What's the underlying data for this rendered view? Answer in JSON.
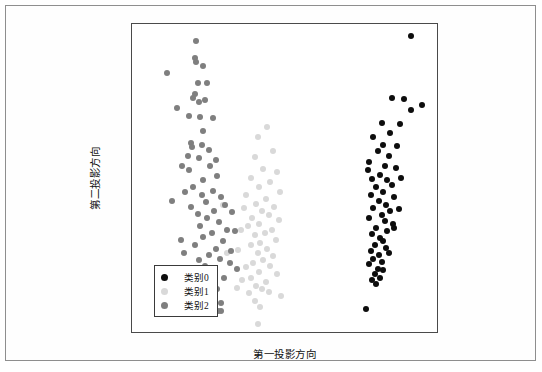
{
  "axes": {
    "xlabel": "第一投影方向",
    "ylabel": "第二投影方向",
    "xticks": [
      "-10.0",
      "-7.5",
      "-5.0",
      "-2.5",
      "0.0",
      "2.5",
      "5.0",
      "7.5",
      "10.0"
    ],
    "yticks": [
      "3",
      "2",
      "1",
      "0",
      "-1",
      "-2"
    ]
  },
  "legend": {
    "items": [
      {
        "label": "类别0",
        "color": "#0d0d0d"
      },
      {
        "label": "类别1",
        "color": "#d9d9d9"
      },
      {
        "label": "类别2",
        "color": "#7f7f7f"
      }
    ]
  },
  "chart_data": {
    "type": "scatter",
    "title": "",
    "xlabel": "第一投影方向",
    "ylabel": "第二投影方向",
    "xlim": [
      -11.0,
      11.0
    ],
    "ylim": [
      -2.35,
      3.0
    ],
    "xticks": [
      -10.0,
      -7.5,
      -5.0,
      -2.5,
      0.0,
      2.5,
      5.0,
      7.5,
      10.0
    ],
    "yticks": [
      -2,
      -1,
      0,
      1,
      2,
      3
    ],
    "grid": false,
    "legend_position": "lower left",
    "marker_size": 6,
    "series": [
      {
        "name": "类别0",
        "color": "#0d0d0d",
        "points": [
          [
            9.0,
            2.8
          ],
          [
            7.6,
            1.72
          ],
          [
            8.5,
            1.7
          ],
          [
            9.0,
            1.52
          ],
          [
            9.8,
            1.6
          ],
          [
            6.9,
            1.3
          ],
          [
            8.2,
            1.28
          ],
          [
            7.5,
            1.12
          ],
          [
            6.3,
            1.05
          ],
          [
            7.0,
            0.92
          ],
          [
            8.0,
            0.9
          ],
          [
            6.6,
            0.8
          ],
          [
            7.4,
            0.72
          ],
          [
            6.0,
            0.62
          ],
          [
            7.1,
            0.55
          ],
          [
            7.9,
            0.52
          ],
          [
            6.8,
            0.4
          ],
          [
            6.2,
            0.33
          ],
          [
            7.3,
            0.3
          ],
          [
            7.6,
            0.22
          ],
          [
            6.5,
            0.18
          ],
          [
            7.0,
            0.1
          ],
          [
            6.1,
            0.05
          ],
          [
            7.8,
            0.02
          ],
          [
            6.7,
            -0.05
          ],
          [
            7.2,
            -0.12
          ],
          [
            6.3,
            -0.18
          ],
          [
            7.5,
            -0.22
          ],
          [
            6.9,
            -0.3
          ],
          [
            6.0,
            -0.35
          ],
          [
            7.1,
            -0.4
          ],
          [
            7.7,
            -0.45
          ],
          [
            6.5,
            -0.52
          ],
          [
            7.3,
            -0.58
          ],
          [
            6.2,
            -0.62
          ],
          [
            6.8,
            -0.7
          ],
          [
            7.0,
            -0.75
          ],
          [
            6.4,
            -0.82
          ],
          [
            7.2,
            -0.86
          ],
          [
            6.1,
            -0.92
          ],
          [
            6.7,
            -0.98
          ],
          [
            7.4,
            -0.95
          ],
          [
            6.3,
            -1.05
          ],
          [
            6.9,
            -1.1
          ],
          [
            6.0,
            -1.15
          ],
          [
            6.6,
            -1.22
          ],
          [
            7.0,
            -1.25
          ],
          [
            6.4,
            -1.32
          ],
          [
            6.8,
            -1.38
          ],
          [
            6.2,
            -1.42
          ],
          [
            6.5,
            -1.48
          ],
          [
            7.8,
            -0.52
          ],
          [
            8.1,
            -0.2
          ],
          [
            8.3,
            0.35
          ],
          [
            5.9,
            0.48
          ],
          [
            5.8,
            -1.92
          ]
        ]
      },
      {
        "name": "类别1",
        "color": "#d9d9d9",
        "points": [
          [
            -1.3,
            1.22
          ],
          [
            -2.0,
            1.05
          ],
          [
            -0.9,
            0.8
          ],
          [
            -2.2,
            0.7
          ],
          [
            -1.6,
            0.5
          ],
          [
            -0.6,
            0.45
          ],
          [
            -2.5,
            0.35
          ],
          [
            -1.1,
            0.28
          ],
          [
            -1.9,
            0.18
          ],
          [
            -0.4,
            0.1
          ],
          [
            -2.8,
            0.05
          ],
          [
            -1.4,
            -0.02
          ],
          [
            -2.1,
            -0.1
          ],
          [
            -0.8,
            -0.15
          ],
          [
            -1.7,
            -0.22
          ],
          [
            -3.0,
            -0.18
          ],
          [
            -1.2,
            -0.3
          ],
          [
            -2.4,
            -0.35
          ],
          [
            -0.5,
            -0.38
          ],
          [
            -1.9,
            -0.45
          ],
          [
            -2.7,
            -0.48
          ],
          [
            -1.0,
            -0.55
          ],
          [
            -1.5,
            -0.6
          ],
          [
            -2.2,
            -0.65
          ],
          [
            -3.2,
            -0.55
          ],
          [
            -0.7,
            -0.72
          ],
          [
            -1.8,
            -0.78
          ],
          [
            -2.5,
            -0.82
          ],
          [
            -1.3,
            -0.88
          ],
          [
            -2.0,
            -0.95
          ],
          [
            -0.9,
            -1.0
          ],
          [
            -3.4,
            -0.9
          ],
          [
            -1.6,
            -1.08
          ],
          [
            -2.3,
            -1.12
          ],
          [
            -1.1,
            -1.18
          ],
          [
            -2.8,
            -1.2
          ],
          [
            -1.9,
            -1.28
          ],
          [
            -0.6,
            -1.32
          ],
          [
            -2.5,
            -1.38
          ],
          [
            -1.4,
            -1.45
          ],
          [
            -3.1,
            -1.42
          ],
          [
            -2.1,
            -1.52
          ],
          [
            -1.7,
            -1.58
          ],
          [
            -2.6,
            -1.65
          ],
          [
            -1.2,
            -1.62
          ],
          [
            -2.2,
            -1.78
          ],
          [
            -1.8,
            -1.88
          ],
          [
            -3.5,
            -1.55
          ],
          [
            -0.3,
            -1.7
          ],
          [
            -2.0,
            -2.18
          ],
          [
            -4.5,
            -0.12
          ],
          [
            -4.2,
            -0.95
          ]
        ]
      },
      {
        "name": "类别2",
        "color": "#7f7f7f",
        "points": [
          [
            -6.4,
            2.7
          ],
          [
            -6.5,
            2.42
          ],
          [
            -6.4,
            2.35
          ],
          [
            -5.9,
            2.28
          ],
          [
            -8.5,
            2.15
          ],
          [
            -6.3,
            1.98
          ],
          [
            -5.6,
            1.98
          ],
          [
            -6.5,
            1.8
          ],
          [
            -6.6,
            1.72
          ],
          [
            -6.2,
            1.65
          ],
          [
            -5.8,
            1.68
          ],
          [
            -6.9,
            1.42
          ],
          [
            -6.1,
            1.4
          ],
          [
            -5.2,
            1.38
          ],
          [
            -5.9,
            1.15
          ],
          [
            -6.8,
            0.95
          ],
          [
            -6.7,
            0.88
          ],
          [
            -6.0,
            0.92
          ],
          [
            -5.5,
            0.82
          ],
          [
            -7.0,
            0.72
          ],
          [
            -6.2,
            0.68
          ],
          [
            -5.0,
            0.65
          ],
          [
            -6.9,
            0.48
          ],
          [
            -5.4,
            0.55
          ],
          [
            -5.9,
            0.3
          ],
          [
            -4.9,
            0.38
          ],
          [
            -6.6,
            0.18
          ],
          [
            -5.2,
            0.12
          ],
          [
            -7.2,
            0.1
          ],
          [
            -6.0,
            0.05
          ],
          [
            -4.6,
            0.02
          ],
          [
            -5.7,
            -0.08
          ],
          [
            -6.8,
            -0.15
          ],
          [
            -4.3,
            -0.12
          ],
          [
            -5.1,
            -0.22
          ],
          [
            -6.3,
            -0.28
          ],
          [
            -3.8,
            -0.25
          ],
          [
            -5.6,
            -0.35
          ],
          [
            -4.8,
            -0.42
          ],
          [
            -6.1,
            -0.48
          ],
          [
            -4.2,
            -0.55
          ],
          [
            -7.5,
            -0.72
          ],
          [
            -5.3,
            -0.6
          ],
          [
            -3.6,
            -0.58
          ],
          [
            -5.9,
            -0.68
          ],
          [
            -4.5,
            -0.75
          ],
          [
            -6.5,
            -0.82
          ],
          [
            -5.0,
            -0.88
          ],
          [
            -3.9,
            -0.92
          ],
          [
            -7.3,
            -0.95
          ],
          [
            -5.5,
            -0.98
          ],
          [
            -4.7,
            -1.05
          ],
          [
            -6.2,
            -1.08
          ],
          [
            -4.0,
            -1.12
          ],
          [
            -5.8,
            -1.18
          ],
          [
            -3.5,
            -1.22
          ],
          [
            -6.8,
            -1.25
          ],
          [
            -5.2,
            -1.32
          ],
          [
            -4.4,
            -1.38
          ],
          [
            -7.6,
            -1.4
          ],
          [
            -6.0,
            -1.45
          ],
          [
            -5.6,
            -1.52
          ],
          [
            -4.9,
            -1.58
          ],
          [
            -7.1,
            -1.62
          ],
          [
            -6.4,
            -1.68
          ],
          [
            -5.1,
            -1.72
          ],
          [
            -4.6,
            -1.82
          ],
          [
            -5.9,
            -1.88
          ],
          [
            -4.85,
            -1.95
          ],
          [
            -4.65,
            -1.95
          ],
          [
            -7.8,
            1.55
          ],
          [
            -7.4,
            0.55
          ],
          [
            -8.1,
            -0.05
          ]
        ]
      }
    ]
  }
}
